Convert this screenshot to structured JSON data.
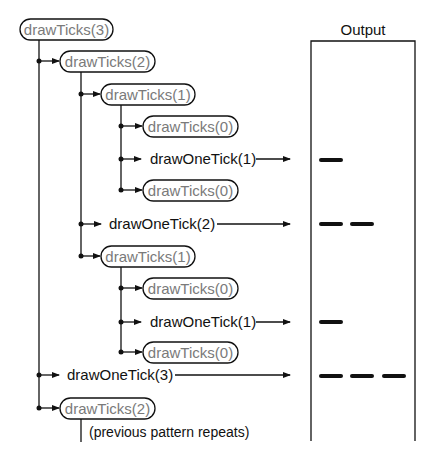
{
  "title": "Output",
  "calls": {
    "root": "drawTicks(3)",
    "t2a": "drawTicks(2)",
    "t1a": "drawTicks(1)",
    "t0a": "drawTicks(0)",
    "one1a": "drawOneTick(1)",
    "t0b": "drawTicks(0)",
    "one2": "drawOneTick(2)",
    "t1b": "drawTicks(1)",
    "t0c": "drawTicks(0)",
    "one1b": "drawOneTick(1)",
    "t0d": "drawTicks(0)",
    "one3": "drawOneTick(3)",
    "t2b": "drawTicks(2)"
  },
  "note": "(previous pattern repeats)",
  "output_ticks": [
    {
      "y": 160,
      "length": 1
    },
    {
      "y": 224,
      "length": 2
    },
    {
      "y": 322,
      "length": 1
    },
    {
      "y": 375,
      "length": 3
    }
  ],
  "colors": {
    "line": "#111111",
    "pill_text": "#7a7a7a",
    "call_text": "#111111"
  }
}
